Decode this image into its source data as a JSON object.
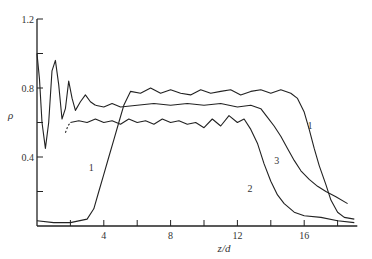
{
  "chart_data": {
    "type": "line",
    "title": "",
    "xlabel": "z/d",
    "ylabel": "ρ",
    "xlim": [
      0,
      19
    ],
    "ylim": [
      0,
      1.2
    ],
    "grid": false,
    "legend": "none (curves labelled inline)",
    "x_ticks": [
      2,
      4,
      6,
      8,
      10,
      12,
      14,
      16,
      18
    ],
    "x_tick_labels": {
      "4": "4",
      "8": "8",
      "12": "12",
      "16": "16"
    },
    "y_ticks": [
      0.2,
      0.4,
      0.6,
      0.8,
      1.0,
      1.2
    ],
    "y_tick_labels": {
      "0.4": "0.4",
      "0.8": "0.8",
      "1.2": "1.2"
    },
    "series": [
      {
        "name": "1",
        "label_pos": {
          "z": 3.1,
          "rho": 0.32
        },
        "label_pos_2": {
          "z": 16.2,
          "rho": 0.56
        },
        "points": [
          [
            0,
            0.03
          ],
          [
            1,
            0.02
          ],
          [
            2,
            0.02
          ],
          [
            3,
            0.04
          ],
          [
            3.4,
            0.1
          ],
          [
            3.7,
            0.2
          ],
          [
            4.0,
            0.3
          ],
          [
            4.3,
            0.4
          ],
          [
            4.6,
            0.5
          ],
          [
            4.9,
            0.6
          ],
          [
            5.2,
            0.7
          ],
          [
            5.6,
            0.78
          ],
          [
            6.2,
            0.77
          ],
          [
            6.8,
            0.8
          ],
          [
            7.4,
            0.77
          ],
          [
            8,
            0.79
          ],
          [
            8.6,
            0.77
          ],
          [
            9.2,
            0.76
          ],
          [
            9.8,
            0.79
          ],
          [
            10.4,
            0.77
          ],
          [
            11,
            0.78
          ],
          [
            11.6,
            0.79
          ],
          [
            12.2,
            0.76
          ],
          [
            12.8,
            0.78
          ],
          [
            13.4,
            0.79
          ],
          [
            14,
            0.77
          ],
          [
            14.6,
            0.79
          ],
          [
            15.2,
            0.77
          ],
          [
            15.6,
            0.74
          ],
          [
            16.0,
            0.66
          ],
          [
            16.3,
            0.56
          ],
          [
            16.6,
            0.45
          ],
          [
            16.9,
            0.35
          ],
          [
            17.3,
            0.24
          ],
          [
            17.6,
            0.15
          ],
          [
            18.0,
            0.08
          ],
          [
            18.4,
            0.05
          ],
          [
            19,
            0.04
          ]
        ]
      },
      {
        "name": "2",
        "label_pos": {
          "z": 12.6,
          "rho": 0.2
        },
        "dashed_start": [
          [
            1.7,
            0.54
          ],
          [
            1.85,
            0.58
          ],
          [
            2.0,
            0.6
          ]
        ],
        "points": [
          [
            2.0,
            0.6
          ],
          [
            2.5,
            0.61
          ],
          [
            3,
            0.6
          ],
          [
            3.5,
            0.62
          ],
          [
            4,
            0.6
          ],
          [
            4.5,
            0.61
          ],
          [
            5,
            0.59
          ],
          [
            5.5,
            0.62
          ],
          [
            6,
            0.6
          ],
          [
            6.5,
            0.61
          ],
          [
            7,
            0.59
          ],
          [
            7.5,
            0.62
          ],
          [
            8,
            0.6
          ],
          [
            8.5,
            0.61
          ],
          [
            9,
            0.59
          ],
          [
            9.5,
            0.6
          ],
          [
            10,
            0.57
          ],
          [
            10.5,
            0.62
          ],
          [
            11,
            0.58
          ],
          [
            11.5,
            0.64
          ],
          [
            12,
            0.6
          ],
          [
            12.4,
            0.62
          ],
          [
            12.8,
            0.56
          ],
          [
            13.2,
            0.48
          ],
          [
            13.6,
            0.36
          ],
          [
            14.0,
            0.26
          ],
          [
            14.4,
            0.18
          ],
          [
            14.8,
            0.13
          ],
          [
            15.4,
            0.08
          ],
          [
            16,
            0.06
          ],
          [
            17,
            0.05
          ],
          [
            18,
            0.03
          ],
          [
            19,
            0.02
          ]
        ]
      },
      {
        "name": "3",
        "label_pos": {
          "z": 14.2,
          "rho": 0.36
        },
        "points": [
          [
            3.5,
            0.7
          ],
          [
            4,
            0.69
          ],
          [
            4.5,
            0.71
          ],
          [
            5,
            0.69
          ],
          [
            6,
            0.7
          ],
          [
            7,
            0.71
          ],
          [
            8,
            0.7
          ],
          [
            9,
            0.71
          ],
          [
            10,
            0.7
          ],
          [
            11,
            0.71
          ],
          [
            12,
            0.69
          ],
          [
            12.8,
            0.7
          ],
          [
            13.4,
            0.68
          ],
          [
            13.8,
            0.63
          ],
          [
            14.2,
            0.58
          ],
          [
            14.6,
            0.52
          ],
          [
            15.0,
            0.45
          ],
          [
            15.4,
            0.38
          ],
          [
            15.8,
            0.32
          ],
          [
            16.3,
            0.27
          ],
          [
            16.8,
            0.23
          ],
          [
            17.3,
            0.2
          ],
          [
            17.9,
            0.17
          ],
          [
            18.6,
            0.13
          ]
        ]
      },
      {
        "name": "oscillating near-field",
        "points": [
          [
            0,
            1.0
          ],
          [
            0.15,
            0.85
          ],
          [
            0.3,
            0.6
          ],
          [
            0.5,
            0.45
          ],
          [
            0.7,
            0.6
          ],
          [
            0.9,
            0.9
          ],
          [
            1.1,
            0.96
          ],
          [
            1.3,
            0.82
          ],
          [
            1.5,
            0.62
          ],
          [
            1.7,
            0.68
          ],
          [
            1.9,
            0.84
          ],
          [
            2.1,
            0.74
          ],
          [
            2.3,
            0.67
          ],
          [
            2.6,
            0.72
          ],
          [
            2.9,
            0.76
          ],
          [
            3.2,
            0.72
          ],
          [
            3.5,
            0.7
          ]
        ]
      }
    ]
  }
}
